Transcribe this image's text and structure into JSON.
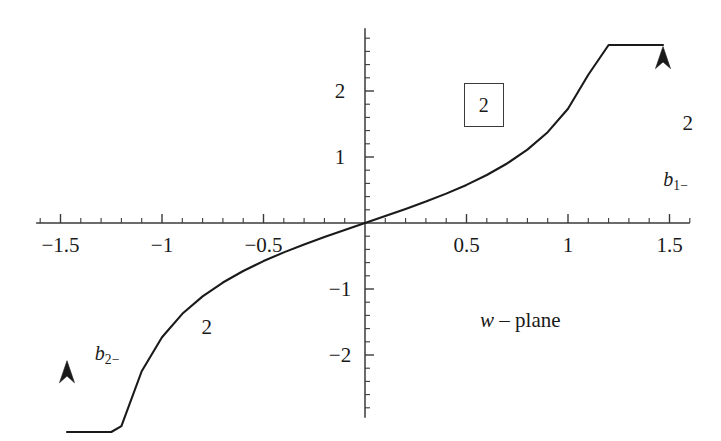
{
  "figure": {
    "caption_label": "w – plane",
    "caption_variable": "w",
    "caption_rest": "– plane",
    "background_color": "#ffffff",
    "curve_color": "#1a1a1a",
    "axis_color": "#3a3a3a"
  },
  "axes": {
    "x": {
      "label": "",
      "range": [
        -1.62,
        1.6
      ],
      "major_ticks": [
        -1.5,
        -1,
        -0.5,
        0.5,
        1,
        1.5
      ],
      "major_tick_labels": [
        "−1.5",
        "−1",
        "−0.5",
        "0.5",
        "1",
        "1.5"
      ],
      "minor_tick_step": 0.1,
      "axis_y_value": 0
    },
    "y": {
      "label": "",
      "range": [
        -2.95,
        2.95
      ],
      "major_ticks": [
        -2,
        -1,
        1,
        2
      ],
      "major_tick_labels": [
        "−2",
        "−1",
        "1",
        "2"
      ],
      "minor_tick_step": 0.2,
      "axis_x_value": 0
    }
  },
  "region_labels": [
    {
      "name": "region-upper-boxed",
      "text": "2",
      "x": 0.585,
      "y": 1.79,
      "boxed": true
    },
    {
      "name": "region-right",
      "text": "2",
      "x": 1.59,
      "y": 1.52,
      "boxed": false
    },
    {
      "name": "region-lower-left",
      "text": "2",
      "x": -0.78,
      "y": -1.58,
      "boxed": false
    }
  ],
  "branch_labels": [
    {
      "name": "branch-label-b1",
      "base": "b",
      "sub": "1−",
      "x": 1.53,
      "y": 0.64
    },
    {
      "name": "branch-label-b2",
      "base": "b",
      "sub": "2−",
      "x": -1.27,
      "y": -2.0
    }
  ],
  "annotations": {
    "plane_text_x": 0.765,
    "plane_text_y": -1.47
  },
  "chart_data": {
    "type": "line",
    "title": "",
    "subtitle": "",
    "xlabel": "",
    "ylabel": "",
    "xlim": [
      -1.62,
      1.6
    ],
    "ylim": [
      -2.95,
      2.95
    ],
    "grid": false,
    "legend": "none",
    "function": "y = tan(pi*x/3)",
    "asymptotes_x": [
      -1.5,
      1.5
    ],
    "series": [
      {
        "name": "b1-",
        "description": "Right branch: rises from origin toward vertical asymptote x = 1.5, arrow pointing up",
        "arrow": {
          "direction": "up",
          "x": 1.468,
          "y": 2.34
        },
        "x": [
          0.0,
          0.1,
          0.2,
          0.3,
          0.4,
          0.5,
          0.6,
          0.7,
          0.8,
          0.9,
          1.0,
          1.1,
          1.2,
          1.25,
          1.3,
          1.34,
          1.38,
          1.41,
          1.43,
          1.45,
          1.455,
          1.46,
          1.465,
          1.468
        ],
        "y": [
          0.0,
          0.105,
          0.213,
          0.325,
          0.445,
          0.577,
          0.727,
          0.902,
          1.111,
          1.376,
          1.732,
          2.246,
          3.078,
          3.732,
          4.705,
          5.976,
          8.386,
          12.17,
          18.26,
          36.5,
          48.6,
          72.9,
          145.9,
          243.2
        ]
      },
      {
        "name": "b2-",
        "description": "Left branch: descends from origin toward vertical asymptote x = -1.5, arrow pointing up (toward origin)",
        "arrow": {
          "direction": "up",
          "x": -1.468,
          "y": -2.42
        },
        "x": [
          0.0,
          -0.1,
          -0.2,
          -0.3,
          -0.4,
          -0.5,
          -0.6,
          -0.7,
          -0.8,
          -0.9,
          -1.0,
          -1.1,
          -1.2,
          -1.25,
          -1.3,
          -1.34,
          -1.38,
          -1.41,
          -1.43,
          -1.45,
          -1.455,
          -1.46,
          -1.465,
          -1.468
        ],
        "y": [
          0.0,
          -0.105,
          -0.213,
          -0.325,
          -0.445,
          -0.577,
          -0.727,
          -0.902,
          -1.111,
          -1.376,
          -1.732,
          -2.246,
          -3.078,
          -3.732,
          -4.705,
          -5.976,
          -8.386,
          -12.17,
          -18.26,
          -36.5,
          -48.6,
          -72.9,
          -145.9,
          -243.2
        ]
      }
    ]
  }
}
